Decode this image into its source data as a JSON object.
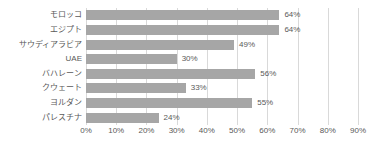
{
  "chart_data": {
    "type": "bar",
    "orientation": "horizontal",
    "title": "",
    "xlabel": "",
    "ylabel": "",
    "categories": [
      "モロッコ",
      "エジプト",
      "サウディアラビア",
      "UAE",
      "バハレーン",
      "クウェート",
      "ヨルダン",
      "パレスチナ"
    ],
    "values": [
      64,
      64,
      49,
      30,
      56,
      33,
      55,
      24
    ],
    "data_labels": [
      "64%",
      "64%",
      "49%",
      "30%",
      "56%",
      "33%",
      "55%",
      "24%"
    ],
    "xlim": [
      0,
      90
    ],
    "xticks": [
      0,
      10,
      20,
      30,
      40,
      50,
      60,
      70,
      80,
      90
    ],
    "xtick_labels": [
      "0%",
      "10%",
      "20%",
      "30%",
      "40%",
      "50%",
      "60%",
      "70%",
      "80%",
      "90%"
    ],
    "grid": "vertical",
    "legend": null,
    "colors": {
      "bar": "#a6a6a6",
      "gridline": "#d9d9d9",
      "text": "#595959",
      "background": "#ffffff"
    }
  }
}
